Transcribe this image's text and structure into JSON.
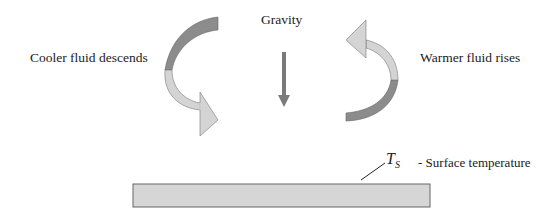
{
  "labels": {
    "cooler": "Cooler fluid descends",
    "warmer": "Warmer fluid rises",
    "gravity": "Gravity",
    "ts_symbol": "T",
    "ts_subscript": "S",
    "surface": "- Surface temperature"
  },
  "colors": {
    "dark_band": "#8c8c8c",
    "light_band": "#d4d4d4",
    "gravity_arrow": "#7a7a7a",
    "surface_plate": "#d6d6d6",
    "outline": "#666666"
  }
}
